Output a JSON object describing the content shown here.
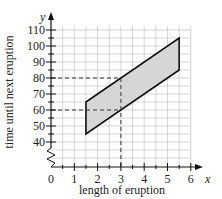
{
  "chart_data": {
    "type": "area",
    "title": "",
    "xlabel": "length of eruption",
    "ylabel": "time until next eruption",
    "x_axis_var": "x",
    "y_axis_var": "y",
    "xlim": [
      0,
      6
    ],
    "ylim": [
      40,
      110
    ],
    "y_axis_break": true,
    "grid": true,
    "grid_minor_x": 0.5,
    "grid_minor_y": 5,
    "x_ticks": [
      0,
      1,
      2,
      3,
      4,
      5,
      6
    ],
    "y_ticks": [
      40,
      50,
      60,
      70,
      80,
      90,
      100,
      110
    ],
    "region": {
      "name": "shaded parallelogram",
      "fill": "#d6d6d6",
      "vertices": [
        [
          1.5,
          45
        ],
        [
          1.5,
          65
        ],
        [
          5.5,
          105
        ],
        [
          5.5,
          85
        ]
      ],
      "upper_boundary": {
        "from": [
          1.5,
          65
        ],
        "to": [
          5.5,
          105
        ]
      },
      "lower_boundary": {
        "from": [
          1.5,
          45
        ],
        "to": [
          5.5,
          85
        ]
      }
    },
    "reference_lines": [
      {
        "type": "vertical",
        "x": 3,
        "style": "dashed"
      },
      {
        "type": "horizontal",
        "y": 80,
        "style": "dashed"
      },
      {
        "type": "horizontal",
        "y": 60,
        "style": "dashed"
      }
    ]
  },
  "labels": {
    "x_title": "length of eruption",
    "y_title": "time until next eruption",
    "x_var": "x",
    "y_var": "y",
    "x_ticks": [
      "0",
      "1",
      "2",
      "3",
      "4",
      "5",
      "6"
    ],
    "y_ticks": [
      "40",
      "50",
      "60",
      "70",
      "80",
      "90",
      "100",
      "110"
    ]
  }
}
